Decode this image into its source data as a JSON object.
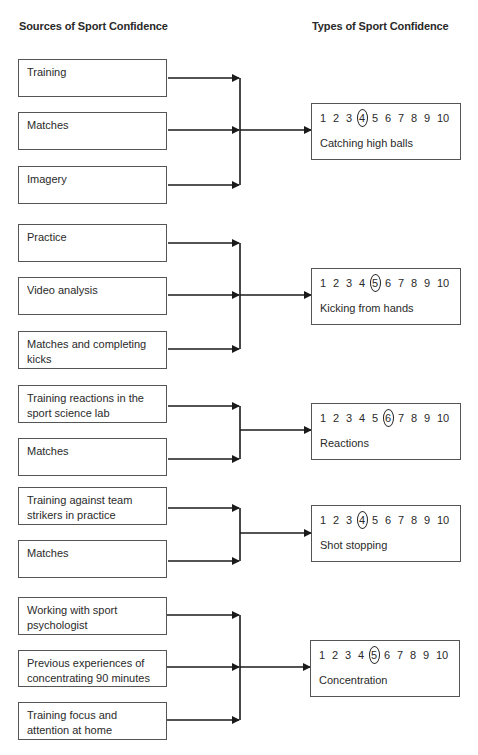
{
  "headers": {
    "sources": "Sources of Sport Confidence",
    "types": "Types of Sport Confidence"
  },
  "scale": [
    "1",
    "2",
    "3",
    "4",
    "5",
    "6",
    "7",
    "8",
    "9",
    "10"
  ],
  "groups": [
    {
      "sources": [
        "Training",
        "Matches",
        "Imagery"
      ],
      "type": "Catching high balls",
      "rating": 4
    },
    {
      "sources": [
        "Practice",
        "Video analysis",
        "Matches and completing kicks"
      ],
      "type": "Kicking from hands",
      "rating": 5
    },
    {
      "sources": [
        "Training reactions in the sport science lab",
        "Matches"
      ],
      "type": "Reactions",
      "rating": 6
    },
    {
      "sources": [
        "Training against team strikers in practice",
        "Matches"
      ],
      "type": "Shot stopping",
      "rating": 4
    },
    {
      "sources": [
        "Working with sport psychologist",
        "Previous experiences of concentrating 90 minutes",
        "Training focus and attention at home"
      ],
      "type": "Concentration",
      "rating": 5
    }
  ],
  "colors": {
    "line": "#1a1a1a",
    "border": "#555555",
    "text": "#2a2a2a"
  }
}
